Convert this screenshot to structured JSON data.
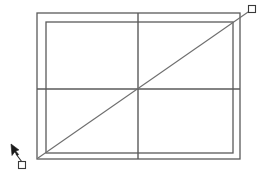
{
  "canvas": {
    "width": 261,
    "height": 176,
    "background_color": "#ffffff",
    "description": "CAD line drawing of nested rectangles with center lines and a diagonal construction line"
  },
  "style": {
    "stroke_color": "#4a4a4a",
    "stroke_color_light": "#6e6e6e",
    "handle_fill": "#ffffff",
    "cursor_fill": "#1a1a1a",
    "line_width": 1.2,
    "thin_line_width": 1
  },
  "shapes": {
    "outer_frame": {
      "name": "outer-frame-rectangle",
      "x": 37,
      "y": 13,
      "width": 203,
      "height": 146
    },
    "inner_rectangle": {
      "name": "inner-rectangle",
      "x": 46,
      "y": 22,
      "width": 187,
      "height": 131
    },
    "center_vertical_line": {
      "name": "center-vertical-line",
      "x1": 138,
      "y1": 13,
      "x2": 138,
      "y2": 159
    },
    "center_horizontal_line": {
      "name": "center-horizontal-line",
      "x1": 37,
      "y1": 89,
      "x2": 240,
      "y2": 89
    },
    "diagonal_line": {
      "name": "diagonal-construction-line",
      "x1": 38,
      "y1": 158,
      "x2": 251,
      "y2": 10
    }
  },
  "handles": {
    "top_right_handle": {
      "name": "grip-handle-top-right",
      "cx": 252,
      "cy": 9,
      "size": 7
    },
    "bottom_left_handle": {
      "name": "grip-handle-bottom-left",
      "cx": 22,
      "cy": 165,
      "size": 7
    }
  },
  "cursor": {
    "name": "arrow-cursor",
    "tip_x": 11,
    "tip_y": 144,
    "leader_x1": 16,
    "leader_y1": 154,
    "leader_x2": 22,
    "leader_y2": 162
  }
}
